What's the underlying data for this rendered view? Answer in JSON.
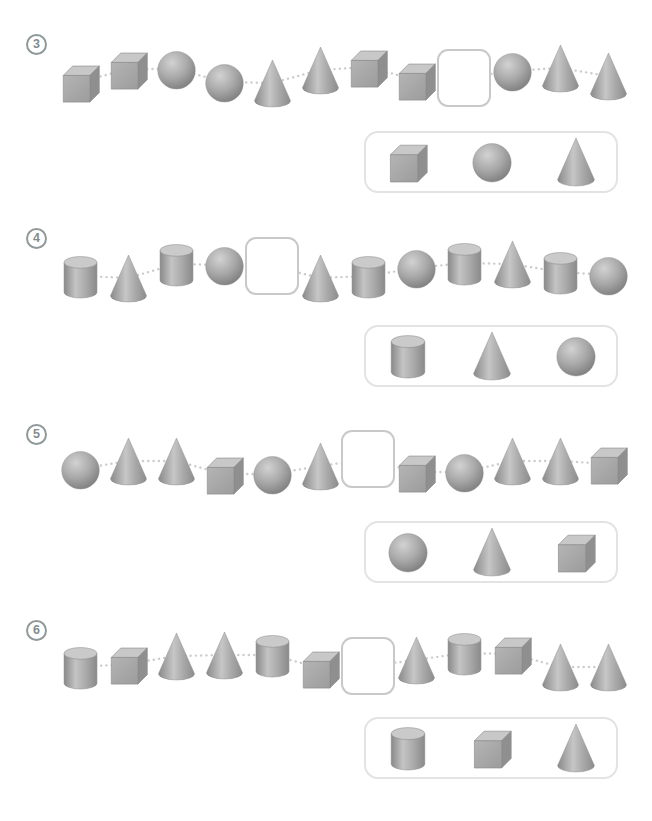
{
  "worksheet": {
    "title": "shape-pattern-worksheet",
    "exercises": [
      {
        "number": "3",
        "sequence": [
          "cube",
          "cube",
          "sphere",
          "sphere",
          "cone",
          "cone",
          "cube",
          "cube",
          "blank",
          "sphere",
          "cone",
          "cone"
        ],
        "offsets": [
          6,
          -7,
          -7,
          6,
          7,
          -6,
          -9,
          4,
          2,
          -5,
          -8,
          0
        ],
        "answers": [
          "cube",
          "sphere",
          "cone"
        ]
      },
      {
        "number": "4",
        "sequence": [
          "cylinder",
          "cone",
          "cylinder",
          "sphere",
          "blank",
          "cone",
          "cylinder",
          "sphere",
          "cylinder",
          "cone",
          "cylinder",
          "sphere"
        ],
        "offsets": [
          6,
          8,
          -6,
          -5,
          -4,
          8,
          6,
          -2,
          -7,
          -6,
          2,
          5
        ],
        "answers": [
          "cylinder",
          "cone",
          "sphere"
        ]
      },
      {
        "number": "5",
        "sequence": [
          "sphere",
          "cone",
          "cone",
          "cube",
          "sphere",
          "cone",
          "blank",
          "cube",
          "sphere",
          "cone",
          "cone",
          "cube"
        ],
        "offsets": [
          3,
          -5,
          -5,
          8,
          8,
          0,
          -7,
          6,
          6,
          -5,
          -5,
          -2
        ],
        "answers": [
          "sphere",
          "cone",
          "cube"
        ]
      },
      {
        "number": "6",
        "sequence": [
          "cylinder",
          "cube",
          "cone",
          "cone",
          "cylinder",
          "cube",
          "blank",
          "cone",
          "cylinder",
          "cube",
          "cone",
          "cone"
        ],
        "offsets": [
          5,
          2,
          -6,
          -7,
          -7,
          6,
          4,
          -2,
          -9,
          -8,
          5,
          5
        ],
        "answers": [
          "cylinder",
          "cube",
          "cone"
        ]
      }
    ]
  },
  "colors": {
    "shape_light": "#c9c9c9",
    "shape_mid": "#a8a8a8",
    "shape_dark": "#8f8f8f",
    "shape_outline": "#8a8a8a",
    "connector_dots": "#cccccc",
    "blank_border": "#c9c9c9",
    "answer_box_border": "#e3e3e3",
    "badge": "#8f9999"
  }
}
